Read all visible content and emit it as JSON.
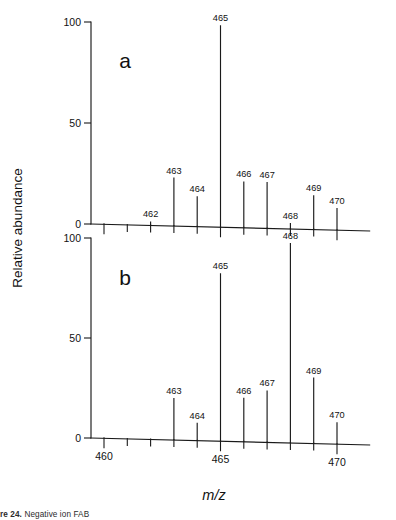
{
  "figure": {
    "y_axis_title": "Relative abundance",
    "x_axis_title": "m/z",
    "caption_lead": "re 24.",
    "caption_rest": "Negative ion FAB"
  },
  "chart_data": [
    {
      "type": "bar",
      "panel_label": "a",
      "title": "",
      "xlabel": "m/z",
      "ylabel": "Relative abundance",
      "xlim": [
        459.3,
        471.4
      ],
      "ylim": [
        0,
        100
      ],
      "xticks_major": [
        460,
        465,
        470
      ],
      "xticks_minor": [
        461,
        462,
        463,
        464,
        466,
        467,
        468,
        469
      ],
      "yticks": [
        0,
        50,
        100
      ],
      "grid": false,
      "legend": "none",
      "categories": [
        462,
        463,
        464,
        465,
        466,
        467,
        468,
        469,
        470
      ],
      "values": [
        2,
        24,
        15,
        100,
        23,
        23,
        3,
        17,
        11
      ],
      "labels": [
        "462",
        "463",
        "464",
        "465",
        "466",
        "467",
        "468",
        "469",
        "470"
      ]
    },
    {
      "type": "bar",
      "panel_label": "b",
      "title": "",
      "xlabel": "m/z",
      "ylabel": "Relative abundance",
      "xlim": [
        459.3,
        471.4
      ],
      "ylim": [
        0,
        100
      ],
      "xticks_major": [
        460,
        465,
        470
      ],
      "xticks_minor": [
        461,
        462,
        463,
        464,
        466,
        467,
        468,
        469
      ],
      "yticks": [
        0,
        50,
        100
      ],
      "grid": false,
      "legend": "none",
      "categories": [
        463,
        464,
        465,
        466,
        467,
        468,
        469,
        470
      ],
      "values": [
        21,
        9,
        84,
        22,
        26,
        100,
        33,
        11
      ],
      "labels": [
        "463",
        "464",
        "465",
        "466",
        "467",
        "468",
        "469",
        "470"
      ]
    }
  ]
}
